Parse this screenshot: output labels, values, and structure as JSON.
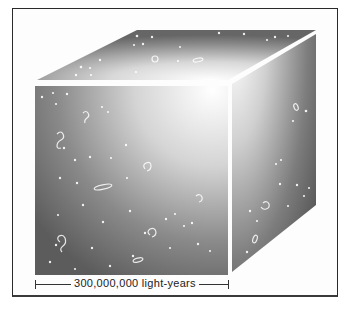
{
  "figure": {
    "scale_bar": {
      "label": "300,000,000 light-years"
    },
    "colors": {
      "frame": "#2a2a2a",
      "face_dark": "#5a5a5a",
      "face_light": "#ffffff",
      "edge_gap": "#ffffff"
    }
  }
}
